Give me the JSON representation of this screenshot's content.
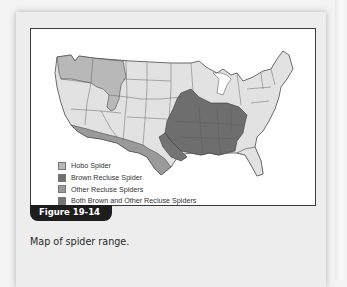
{
  "figure": {
    "label": "Figure 19-14",
    "caption": "Map of spider range."
  },
  "map": {
    "region": "Contiguous United States",
    "legend": [
      {
        "label": "Hobo Spider",
        "color": "#b8b8b8"
      },
      {
        "label": "Brown Recluse Spider",
        "color": "#6e6e6e"
      },
      {
        "label": "Other Recluse Spiders",
        "color": "#9a9a9a"
      },
      {
        "label": "Both Brown and Other Recluse Spiders",
        "color": "#747474"
      }
    ],
    "colors": {
      "base_state": "#e2e2e2",
      "hobo": "#b8b8b8",
      "brown_recluse": "#6e6e6e",
      "other_recluse": "#9a9a9a",
      "both": "#747474",
      "border": "#4a4a4a"
    }
  }
}
